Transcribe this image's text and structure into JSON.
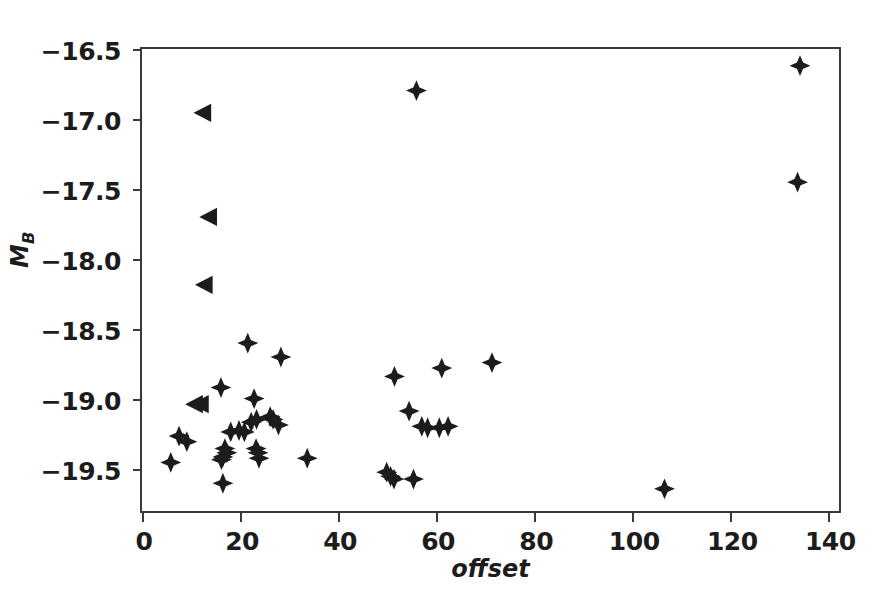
{
  "chart_data": {
    "type": "scatter",
    "title": "",
    "xlabel": "offset",
    "ylabel": "M_B",
    "ylabel_base": "M",
    "ylabel_sub": "B",
    "xlim": [
      0,
      143
    ],
    "ylim": [
      -19.83,
      -16.5
    ],
    "y_inverted": true,
    "grid": false,
    "legend": null,
    "xticks": [
      0,
      20,
      40,
      60,
      80,
      100,
      120,
      140
    ],
    "xtick_labels": [
      "0",
      "20",
      "40",
      "60",
      "80",
      "100",
      "120",
      "140"
    ],
    "yticks": [
      -16.5,
      -17.0,
      -17.5,
      -18.0,
      -18.5,
      -19.0,
      -19.5
    ],
    "ytick_labels": [
      "−16.5",
      "−17.0",
      "−17.5",
      "−18.0",
      "−18.5",
      "−19.0",
      "−19.5"
    ],
    "marker_color": "#1c1c1c",
    "series": [
      {
        "name": "detections",
        "marker": "four-pointed-star",
        "points": [
          [
            135.0,
            -16.62
          ],
          [
            56.3,
            -16.8
          ],
          [
            134.5,
            -17.46
          ],
          [
            21.7,
            -18.62
          ],
          [
            28.5,
            -18.72
          ],
          [
            71.8,
            -18.76
          ],
          [
            61.5,
            -18.8
          ],
          [
            51.8,
            -18.86
          ],
          [
            16.2,
            -18.94
          ],
          [
            23.0,
            -19.02
          ],
          [
            54.8,
            -19.11
          ],
          [
            26.3,
            -19.15
          ],
          [
            26.9,
            -19.17
          ],
          [
            23.5,
            -19.17
          ],
          [
            22.4,
            -19.19
          ],
          [
            28.0,
            -19.21
          ],
          [
            57.4,
            -19.22
          ],
          [
            58.6,
            -19.23
          ],
          [
            61.0,
            -19.23
          ],
          [
            62.8,
            -19.22
          ],
          [
            18.2,
            -19.26
          ],
          [
            19.9,
            -19.25
          ],
          [
            21.0,
            -19.26
          ],
          [
            7.6,
            -19.29
          ],
          [
            9.2,
            -19.33
          ],
          [
            17.0,
            -19.38
          ],
          [
            17.4,
            -19.41
          ],
          [
            23.4,
            -19.38
          ],
          [
            23.8,
            -19.41
          ],
          [
            16.6,
            -19.44
          ],
          [
            24.0,
            -19.45
          ],
          [
            33.9,
            -19.45
          ],
          [
            5.9,
            -19.48
          ],
          [
            16.3,
            -19.46
          ],
          [
            50.2,
            -19.55
          ],
          [
            51.0,
            -19.58
          ],
          [
            51.7,
            -19.6
          ],
          [
            55.7,
            -19.6
          ],
          [
            16.6,
            -19.63
          ],
          [
            107.2,
            -19.67
          ]
        ]
      },
      {
        "name": "upper-limits",
        "marker": "triangle-left",
        "points": [
          [
            12.6,
            -16.96
          ],
          [
            13.8,
            -17.71
          ],
          [
            12.9,
            -18.2
          ],
          [
            10.9,
            -19.06
          ],
          [
            12.1,
            -19.06
          ]
        ]
      }
    ]
  }
}
